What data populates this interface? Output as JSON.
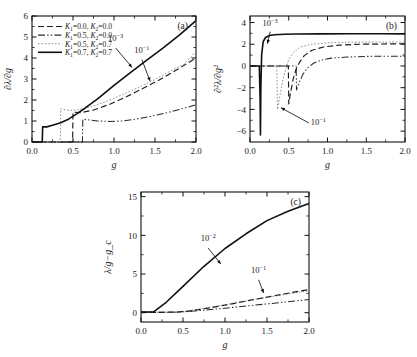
{
  "figure": {
    "panels": [
      "(a)",
      "(b)",
      "(c)"
    ],
    "xlabel": "g",
    "xticks": [
      "0.0",
      "0.5",
      "1.0",
      "1.5",
      "2.0"
    ],
    "xlim": [
      0.0,
      2.0
    ]
  },
  "legend": {
    "entries": [
      {
        "label": "K₁=0.0, K₂=0.0",
        "style": "dashed"
      },
      {
        "label": "K₁=0.5, K₂=0.0",
        "style": "dash-dot-dot"
      },
      {
        "label": "K₁=0.5, K₂=0.7",
        "style": "dotted"
      },
      {
        "label": "K₁=0.7, K₂=0.7",
        "style": "solid"
      }
    ]
  },
  "panel_a": {
    "label": "(a)",
    "ylabel": "∂λ/∂g",
    "yticks": [
      "0",
      "1",
      "2",
      "3",
      "4",
      "5",
      "6"
    ],
    "ylim": [
      0,
      6
    ],
    "annotations": [
      {
        "text": "10⁻³",
        "x": 1.05,
        "y": 4.55
      },
      {
        "text": "10⁻¹",
        "x": 1.3,
        "y": 3.95
      }
    ]
  },
  "panel_b": {
    "label": "(b)",
    "ylabel": "∂²λ/∂g²",
    "yticks": [
      "4",
      "2",
      "0",
      "-2",
      "-4",
      "-6"
    ],
    "ylim": [
      -7,
      4.6
    ],
    "annotations": [
      {
        "text": "10⁻³",
        "x": 0.25,
        "y": 3.5
      },
      {
        "text": "10⁻¹",
        "x": 0.82,
        "y": -5.3
      }
    ]
  },
  "panel_c": {
    "label": "(c)",
    "ylabel": "λ/g−g_c",
    "yticks": [
      "0",
      "5",
      "10",
      "15"
    ],
    "ylim": [
      -1.2,
      15.6
    ],
    "annotations": [
      {
        "text": "10⁻²",
        "x": 0.82,
        "y": 8.6
      },
      {
        "text": "10⁻¹",
        "x": 1.44,
        "y": 4.6
      }
    ]
  },
  "chart_data": [
    {
      "type": "line",
      "title": "(a)",
      "xlabel": "g",
      "ylabel": "∂λ/∂g",
      "xlim": [
        0.0,
        2.0
      ],
      "ylim": [
        0,
        6
      ],
      "grid": false,
      "legend_position": "upper-left",
      "annotations": [
        "10⁻³",
        "10⁻¹"
      ],
      "series": [
        {
          "name": "K₁=0.7, K₂=0.7",
          "style": "solid",
          "jump_g": 0.13,
          "x": [
            0.0,
            0.05,
            0.1,
            0.125,
            0.13,
            0.18,
            0.25,
            0.35,
            0.45,
            0.55,
            0.65,
            0.8,
            1.0,
            1.2,
            1.4,
            1.6,
            1.8,
            2.0
          ],
          "y": [
            0.0,
            0.0,
            0.0,
            0.0,
            0.72,
            0.72,
            0.8,
            0.92,
            1.1,
            1.35,
            1.62,
            2.05,
            2.7,
            3.3,
            3.9,
            4.48,
            5.1,
            5.78
          ]
        },
        {
          "name": "K₁=0.5, K₂=0.7",
          "style": "dotted",
          "jump_g": 0.35,
          "x": [
            0.0,
            0.1,
            0.2,
            0.3,
            0.345,
            0.35,
            0.45,
            0.55,
            0.7,
            0.9,
            1.1,
            1.3,
            1.5,
            1.7,
            1.85,
            2.0
          ],
          "y": [
            0.0,
            0.0,
            0.0,
            0.0,
            0.0,
            1.58,
            1.5,
            1.52,
            1.66,
            1.92,
            2.25,
            2.6,
            2.98,
            3.4,
            3.7,
            4.3
          ]
        },
        {
          "name": "K₁=0.0, K₂=0.0",
          "style": "dashed",
          "jump_g": 0.5,
          "x": [
            0.0,
            0.15,
            0.3,
            0.45,
            0.495,
            0.5,
            0.6,
            0.75,
            0.95,
            1.15,
            1.35,
            1.55,
            1.75,
            2.0
          ],
          "y": [
            0.0,
            0.0,
            0.0,
            0.0,
            0.0,
            1.42,
            1.4,
            1.52,
            1.8,
            2.15,
            2.55,
            2.95,
            3.4,
            4.0
          ]
        },
        {
          "name": "K₁=0.5, K₂=0.0",
          "style": "dash-dot-dot",
          "jump_g": 0.62,
          "x": [
            0.0,
            0.2,
            0.4,
            0.58,
            0.615,
            0.62,
            0.7,
            0.8,
            0.95,
            1.1,
            1.25,
            1.45,
            1.65,
            1.85,
            2.0
          ],
          "y": [
            0.0,
            0.0,
            0.0,
            0.0,
            0.0,
            1.08,
            1.05,
            1.0,
            0.98,
            1.0,
            1.08,
            1.22,
            1.4,
            1.6,
            1.78
          ]
        }
      ]
    },
    {
      "type": "line",
      "title": "(b)",
      "xlabel": "g",
      "ylabel": "∂²λ/∂g²",
      "xlim": [
        0.0,
        2.0
      ],
      "ylim": [
        -7,
        4.6
      ],
      "grid": false,
      "annotations": [
        "10⁻³",
        "10⁻¹"
      ],
      "series": [
        {
          "name": "K₁=0.7, K₂=0.7",
          "style": "solid",
          "spike_g": 0.135,
          "spike_min": -6.35,
          "x": [
            0.0,
            0.08,
            0.12,
            0.13,
            0.135,
            0.14,
            0.15,
            0.17,
            0.2,
            0.25,
            0.32,
            0.45,
            0.6,
            0.9,
            1.3,
            1.7,
            2.0
          ],
          "y": [
            0.0,
            0.0,
            0.0,
            -3.0,
            -6.35,
            -2.0,
            1.0,
            2.25,
            2.62,
            2.8,
            2.88,
            2.92,
            2.94,
            2.95,
            2.96,
            2.96,
            2.95
          ]
        },
        {
          "name": "K₁=0.5, K₂=0.7",
          "style": "dotted",
          "spike_g": 0.355,
          "spike_min": -4.0,
          "x": [
            0.0,
            0.15,
            0.3,
            0.345,
            0.355,
            0.37,
            0.42,
            0.47,
            0.5,
            0.56,
            0.65,
            0.8,
            1.0,
            1.25,
            1.55,
            1.8,
            2.0
          ],
          "y": [
            0.0,
            0.0,
            0.0,
            0.0,
            -4.0,
            -3.4,
            -1.4,
            -0.05,
            0.6,
            1.25,
            1.75,
            2.0,
            2.12,
            2.18,
            2.2,
            2.2,
            2.2
          ]
        },
        {
          "name": "K₁=0.0, K₂=0.0",
          "style": "dashed",
          "spike_g": 0.5,
          "spike_min": -3.5,
          "x": [
            0.0,
            0.2,
            0.4,
            0.495,
            0.5,
            0.52,
            0.56,
            0.6,
            0.64,
            0.7,
            0.8,
            0.95,
            1.15,
            1.4,
            1.7,
            2.0
          ],
          "y": [
            0.0,
            0.0,
            0.0,
            0.0,
            -3.5,
            -2.6,
            -1.1,
            -0.2,
            0.35,
            0.95,
            1.45,
            1.75,
            1.92,
            2.0,
            2.02,
            2.05
          ]
        },
        {
          "name": "K₁=0.5, K₂=0.0",
          "style": "dash-dot-dot",
          "spike_g": 0.6,
          "spike_min": -2.2,
          "x": [
            0.0,
            0.25,
            0.45,
            0.595,
            0.6,
            0.63,
            0.68,
            0.74,
            0.82,
            0.92,
            1.05,
            1.25,
            1.5,
            1.75,
            2.0
          ],
          "y": [
            0.0,
            0.0,
            0.0,
            0.0,
            -2.2,
            -1.6,
            -0.8,
            -0.2,
            0.25,
            0.55,
            0.72,
            0.82,
            0.88,
            0.9,
            0.9
          ]
        }
      ]
    },
    {
      "type": "line",
      "title": "(c)",
      "xlabel": "g",
      "ylabel": "λ/g−g_c",
      "xlim": [
        0.0,
        2.0
      ],
      "ylim": [
        -1.2,
        15.6
      ],
      "grid": false,
      "annotations": [
        "10⁻²",
        "10⁻¹"
      ],
      "series": [
        {
          "name": "K₁=0.7, K₂=0.7",
          "style": "solid",
          "x": [
            0.0,
            0.1,
            0.15,
            0.3,
            0.5,
            0.75,
            1.0,
            1.25,
            1.5,
            1.75,
            2.0
          ],
          "y": [
            0.1,
            0.1,
            0.1,
            1.35,
            3.4,
            6.0,
            8.3,
            10.2,
            11.9,
            13.1,
            14.1
          ]
        },
        {
          "name": "K₁=0.0, K₂=0.0",
          "style": "dashed",
          "x": [
            0.0,
            0.2,
            0.4,
            0.55,
            0.7,
            0.9,
            1.1,
            1.35,
            1.6,
            1.8,
            2.0
          ],
          "y": [
            0.05,
            0.05,
            0.08,
            0.18,
            0.42,
            0.78,
            1.18,
            1.72,
            2.22,
            2.62,
            3.0
          ]
        },
        {
          "name": "K₁=0.5, K₂=0.7",
          "style": "dotted",
          "x": [
            0.0,
            0.2,
            0.4,
            0.55,
            0.7,
            0.9,
            1.1,
            1.35,
            1.6,
            1.8,
            2.0
          ],
          "y": [
            0.05,
            0.05,
            0.1,
            0.24,
            0.5,
            0.85,
            1.22,
            1.7,
            2.15,
            2.5,
            2.85
          ]
        },
        {
          "name": "K₁=0.5, K₂=0.0",
          "style": "dash-dot-dot",
          "x": [
            0.0,
            0.25,
            0.45,
            0.6,
            0.8,
            1.0,
            1.25,
            1.5,
            1.75,
            2.0
          ],
          "y": [
            0.05,
            0.05,
            0.08,
            0.18,
            0.38,
            0.58,
            0.86,
            1.14,
            1.42,
            1.7
          ]
        }
      ]
    }
  ]
}
